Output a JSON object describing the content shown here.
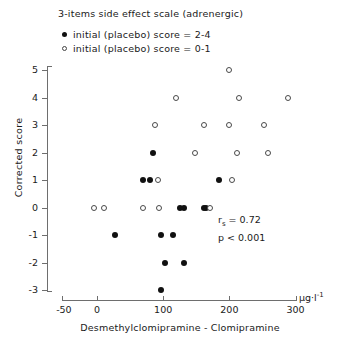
{
  "chart_data": {
    "type": "scatter",
    "title": "3-items side effect scale (adrenergic)",
    "xlabel": "Desmethylclomipramine - Clomipramine",
    "ylabel": "Corrected score",
    "xunit": "µg·l",
    "xunit_exp": "-1",
    "grid": false,
    "xlim": [
      -50,
      300
    ],
    "ylim": [
      -3,
      5
    ],
    "xticks": [
      -50,
      0,
      100,
      200,
      300
    ],
    "xtick_labels": [
      "-50",
      "0",
      "100",
      "200",
      "300"
    ],
    "yticks": [
      5,
      4,
      3,
      2,
      1,
      0,
      -1,
      -2,
      -3
    ],
    "ytick_labels": [
      "5",
      "4",
      "3",
      "2",
      "1",
      "0",
      "-1",
      "-2",
      "-3"
    ],
    "legend_position": "top-left",
    "annotations": [
      "r_s = 0.72",
      "p < 0.001"
    ],
    "series": [
      {
        "name": "initial (placebo) score = 2-4",
        "marker": "filled-circle",
        "color": "#111111",
        "points": [
          [
            85,
            2
          ],
          [
            70,
            1
          ],
          [
            80,
            1
          ],
          [
            184,
            1
          ],
          [
            126,
            0
          ],
          [
            132,
            0
          ],
          [
            164,
            0
          ],
          [
            161,
            0
          ],
          [
            27,
            -1
          ],
          [
            97,
            -1
          ],
          [
            115,
            -1
          ],
          [
            103,
            -2
          ],
          [
            132,
            -2
          ],
          [
            97,
            -3
          ]
        ]
      },
      {
        "name": "initial (placebo) score = 0-1",
        "marker": "open-circle",
        "color": "#4a4a4a",
        "points": [
          [
            199,
            5
          ],
          [
            120,
            4
          ],
          [
            215,
            4
          ],
          [
            289,
            4
          ],
          [
            88,
            3
          ],
          [
            161,
            3
          ],
          [
            199,
            3
          ],
          [
            252,
            3
          ],
          [
            148,
            2
          ],
          [
            212,
            2
          ],
          [
            259,
            2
          ],
          [
            92,
            1
          ],
          [
            204,
            1
          ],
          [
            -5,
            0
          ],
          [
            11,
            0
          ],
          [
            70,
            0
          ],
          [
            94,
            0
          ],
          [
            171,
            0
          ]
        ]
      }
    ]
  },
  "legend": {
    "items": [
      {
        "marker": "filled-circle",
        "label": "initial (placebo) score = 2-4"
      },
      {
        "marker": "open-circle",
        "label": "initial (placebo) score = 0-1"
      }
    ]
  },
  "stats": {
    "correlation_prefix": "r",
    "correlation_sub": "s",
    "correlation_value": "= 0.72",
    "pvalue": "p < 0.001"
  }
}
